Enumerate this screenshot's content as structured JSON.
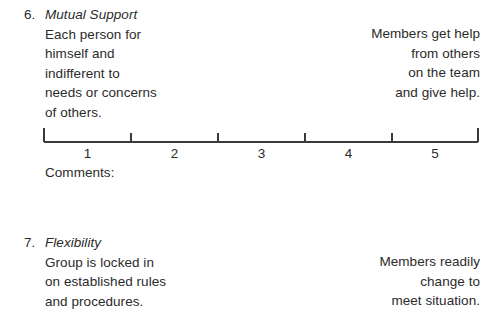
{
  "document": {
    "background_color": "#ffffff",
    "text_color": "#2b2b2b",
    "rule_color": "#3a3a3a"
  },
  "items": [
    {
      "number": "6.",
      "title": "Mutual Support",
      "left_anchor_lines": [
        "Each person for",
        "himself and",
        "indifferent to",
        "needs or concerns",
        "of others."
      ],
      "right_anchor_lines": [
        "Members get help",
        "from others",
        "on the team",
        "and give help."
      ],
      "scale": {
        "labels": [
          "1",
          "2",
          "3",
          "4",
          "5"
        ],
        "tick_positions": [
          44,
          131,
          218,
          305,
          392,
          478
        ],
        "label_positions": [
          87.5,
          174.5,
          261.5,
          348.5,
          435
        ],
        "line_y": 14,
        "end_tick_top": 0,
        "mid_tick_top": 5
      },
      "comments_label": "Comments:"
    },
    {
      "number": "7.",
      "title": "Flexibility",
      "left_anchor_lines": [
        "Group is locked in",
        "on established rules",
        "and procedures."
      ],
      "right_anchor_lines": [
        "Members readily",
        "change to",
        "meet situation."
      ]
    }
  ]
}
